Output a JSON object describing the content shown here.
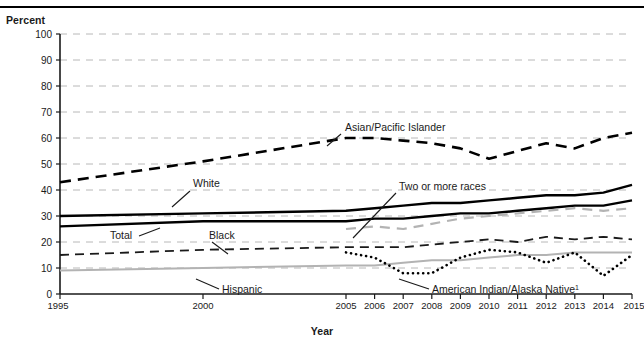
{
  "figure": {
    "y_axis_title": "Percent",
    "x_axis_title": "Year"
  },
  "chart_data": {
    "type": "line",
    "title": "",
    "subtitle": "",
    "xlabel": "Year",
    "ylabel": "Percent",
    "ylim": [
      0,
      100
    ],
    "xlim": [
      1995,
      2015
    ],
    "grid": true,
    "grid_axis": "y",
    "legend_position": "inline-annotations",
    "y_ticks": [
      0,
      10,
      20,
      30,
      40,
      50,
      60,
      70,
      80,
      90,
      100
    ],
    "x_ticks": [
      1995,
      2000,
      2005,
      2006,
      2007,
      2008,
      2009,
      2010,
      2011,
      2012,
      2013,
      2014,
      2015
    ],
    "x_tick_labels": [
      "1995",
      "2000",
      "2005",
      "2006",
      "2007",
      "2008",
      "2009",
      "2010",
      "2011",
      "2012",
      "2013",
      "2014",
      "2015"
    ],
    "footnote_marker": "1",
    "series": [
      {
        "name": "Asian/Pacific Islander",
        "label": "Asian/Pacific Islander",
        "style": "dashed-bold",
        "color": "#000000",
        "x": [
          1995,
          2000,
          2005,
          2006,
          2007,
          2008,
          2009,
          2010,
          2011,
          2012,
          2013,
          2014,
          2015
        ],
        "values": [
          43,
          51,
          60,
          60,
          59,
          58,
          56,
          52,
          55,
          58,
          56,
          60,
          62
        ]
      },
      {
        "name": "White",
        "label": "White",
        "style": "solid-bold",
        "color": "#000000",
        "x": [
          1995,
          2000,
          2005,
          2006,
          2007,
          2008,
          2009,
          2010,
          2011,
          2012,
          2013,
          2014,
          2015
        ],
        "values": [
          30,
          31,
          32,
          33,
          34,
          35,
          35,
          36,
          37,
          38,
          38,
          39,
          42
        ]
      },
      {
        "name": "Total",
        "label": "Total",
        "style": "solid-bold",
        "color": "#000000",
        "x": [
          1995,
          2000,
          2005,
          2006,
          2007,
          2008,
          2009,
          2010,
          2011,
          2012,
          2013,
          2014,
          2015
        ],
        "values": [
          26,
          28,
          28,
          29,
          29,
          30,
          31,
          31,
          32,
          33,
          34,
          34,
          36
        ]
      },
      {
        "name": "Two or more races",
        "label": "Two or more races",
        "style": "dashed-gray",
        "color": "#b3b3b3",
        "x": [
          2005,
          2006,
          2007,
          2008,
          2009,
          2010,
          2011,
          2012,
          2013,
          2014,
          2015
        ],
        "values": [
          25,
          26,
          25,
          27,
          29,
          30,
          31,
          32,
          33,
          32,
          33
        ]
      },
      {
        "name": "Black",
        "label": "Black",
        "style": "dashed",
        "color": "#1a1a1a",
        "x": [
          1995,
          2000,
          2005,
          2006,
          2007,
          2008,
          2009,
          2010,
          2011,
          2012,
          2013,
          2014,
          2015
        ],
        "values": [
          15,
          17,
          18,
          18,
          18,
          19,
          20,
          21,
          20,
          22,
          21,
          22,
          21
        ]
      },
      {
        "name": "Hispanic",
        "label": "Hispanic",
        "style": "solid-gray",
        "color": "#b3b3b3",
        "x": [
          1995,
          2000,
          2005,
          2006,
          2007,
          2008,
          2009,
          2010,
          2011,
          2012,
          2013,
          2014,
          2015
        ],
        "values": [
          9,
          10,
          11,
          11,
          12,
          13,
          13,
          14,
          15,
          15,
          16,
          16,
          16
        ]
      },
      {
        "name": "American Indian/Alaska Native",
        "label": "American Indian/Alaska Native",
        "style": "dotted",
        "color": "#000000",
        "x": [
          2005,
          2006,
          2007,
          2008,
          2009,
          2010,
          2011,
          2012,
          2013,
          2014,
          2015
        ],
        "values": [
          16,
          14,
          8,
          8,
          14,
          17,
          16,
          12,
          16,
          7,
          15
        ]
      }
    ],
    "annotations": [
      {
        "text": "Asian/Pacific Islander",
        "for": "Asian/Pacific Islander"
      },
      {
        "text": "White",
        "for": "White"
      },
      {
        "text": "Total",
        "for": "Total"
      },
      {
        "text": "Black",
        "for": "Black"
      },
      {
        "text": "Two or more races",
        "for": "Two or more races"
      },
      {
        "text": "Hispanic",
        "for": "Hispanic"
      },
      {
        "text": "American Indian/Alaska Native",
        "for": "American Indian/Alaska Native"
      }
    ]
  }
}
